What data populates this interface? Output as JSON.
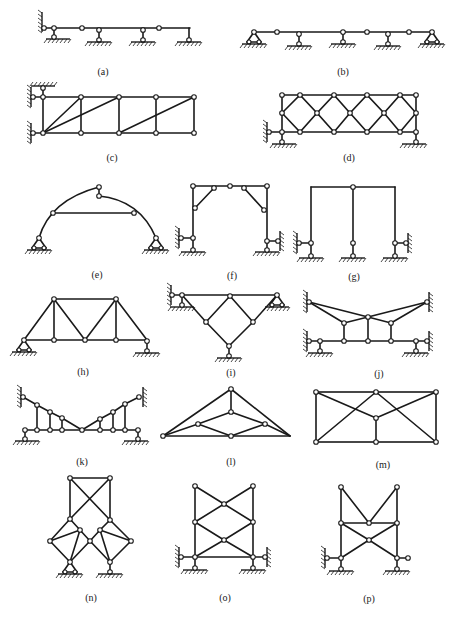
{
  "figure": {
    "panels": [
      {
        "id": "a",
        "label": "(a)",
        "type": "multi-span hinged beam"
      },
      {
        "id": "b",
        "label": "(b)",
        "type": "multi-span hinged beam"
      },
      {
        "id": "c",
        "label": "(c)",
        "type": "truss with wall supports"
      },
      {
        "id": "d",
        "label": "(d)",
        "type": "diamond-braced truss"
      },
      {
        "id": "e",
        "label": "(e)",
        "type": "three-hinged arch with tie"
      },
      {
        "id": "f",
        "label": "(f)",
        "type": "portal frame with knee braces"
      },
      {
        "id": "g",
        "label": "(g)",
        "type": "two-bay frame"
      },
      {
        "id": "h",
        "label": "(h)",
        "type": "simple truss"
      },
      {
        "id": "i",
        "label": "(i)",
        "type": "inverted triangular truss"
      },
      {
        "id": "j",
        "label": "(j)",
        "type": "suspended combined system"
      },
      {
        "id": "k",
        "label": "(k)",
        "type": "combined beam-cable system"
      },
      {
        "id": "l",
        "label": "(l)",
        "type": "triangular roof truss"
      },
      {
        "id": "m",
        "label": "(m)",
        "type": "rectangular truss"
      },
      {
        "id": "n",
        "label": "(n)",
        "type": "tower truss"
      },
      {
        "id": "o",
        "label": "(o)",
        "type": "X-braced tower"
      },
      {
        "id": "p",
        "label": "(p)",
        "type": "braced tower frame"
      }
    ]
  },
  "colors": {
    "line": "#1a1a1a",
    "background": "#ffffff",
    "joint_fill": "#ffffff"
  }
}
